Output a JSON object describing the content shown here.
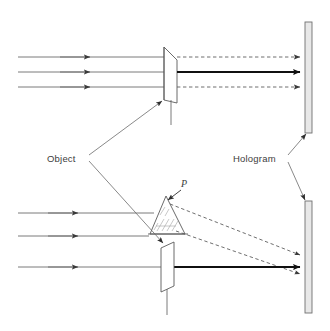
{
  "figure": {
    "type": "optics-ray-diagram",
    "title": "",
    "background_color": "#ffffff",
    "width": 330,
    "height": 331
  },
  "labels": {
    "object": "Object",
    "hologram": "Hologram",
    "point_p": "P"
  },
  "colors": {
    "ray_line": "#6b6b6b",
    "ray_bold": "#1a1a1a",
    "outline": "#5a5a5a",
    "plate_fill": "#e8e8e8",
    "plate_stroke": "#707070",
    "text": "#3d3d3d",
    "dashed": "#5f5f5f"
  },
  "panels": [
    {
      "name": "upper-panel",
      "description": "Parallel beam illuminating a flat object; undiffracted rays continue to the hologram plate",
      "incoming_rays": [
        {
          "y": 57,
          "x_start": 18,
          "x_end": 166,
          "arrow_x": 88
        },
        {
          "y": 72,
          "x_start": 18,
          "x_end": 166,
          "arrow_x": 88
        },
        {
          "y": 87,
          "x_start": 18,
          "x_end": 166,
          "arrow_x": 88
        }
      ],
      "outgoing_rays": [
        {
          "y": 57,
          "x_start": 176,
          "x_end": 300,
          "style": "dashed"
        },
        {
          "y": 72,
          "x_start": 176,
          "x_end": 300,
          "style": "solid-bold"
        },
        {
          "y": 87,
          "x_start": 176,
          "x_end": 300,
          "style": "dashed"
        }
      ],
      "object": {
        "shape": "flat-plate-arrowhead",
        "x": 163,
        "y_top": 47,
        "y_bottom": 100,
        "stem_y_bottom": 125
      },
      "hologram_plate": {
        "x": 305,
        "y_top": 22,
        "y_bottom": 133,
        "width": 7
      }
    },
    {
      "name": "lower-panel",
      "description": "Parallel beam scattering off point P on a three-dimensional object; diffracted rays diverge toward the hologram plate",
      "incoming_rays": [
        {
          "y": 213,
          "x_start": 18,
          "x_end": 152,
          "arrow_x": 75
        },
        {
          "y": 236,
          "x_start": 18,
          "x_end": 147,
          "arrow_x": 75
        },
        {
          "y": 267,
          "x_start": 18,
          "x_end": 166,
          "arrow_x": 75
        }
      ],
      "outgoing_rays": [
        {
          "from": [
            176,
            203
          ],
          "to": [
            300,
            253
          ],
          "style": "dashed"
        },
        {
          "from": [
            176,
            228
          ],
          "to": [
            300,
            272
          ],
          "style": "dashed"
        },
        {
          "from": [
            176,
            267
          ],
          "to": [
            300,
            267
          ],
          "style": "solid-bold"
        }
      ],
      "object_triangle": {
        "apex": [
          166,
          196
        ],
        "left": [
          150,
          234
        ],
        "right": [
          184,
          234
        ],
        "hatched": true,
        "point_label": "P"
      },
      "object_plate": {
        "shape": "parallelogram",
        "x": 160,
        "y_top": 244,
        "y_bottom": 292,
        "stem_y_bottom": 315
      },
      "hologram_plate": {
        "x": 305,
        "y_top": 201,
        "y_bottom": 313,
        "width": 7
      }
    }
  ],
  "annotations": [
    {
      "name": "object-callout",
      "text": "Object",
      "text_x": 47,
      "text_y": 159,
      "leaders": [
        {
          "from": [
            88,
            156
          ],
          "to": [
            161,
            100
          ]
        },
        {
          "from": [
            88,
            160
          ],
          "to": [
            163,
            242
          ]
        }
      ]
    },
    {
      "name": "hologram-callout",
      "text": "Hologram",
      "text_x": 238,
      "text_y": 159,
      "leaders": [
        {
          "from": [
            287,
            155
          ],
          "to": [
            305,
            131
          ]
        },
        {
          "from": [
            287,
            162
          ],
          "to": [
            304,
            203
          ]
        }
      ]
    },
    {
      "name": "p-callout",
      "text": "P",
      "text_x": 182,
      "text_y": 187,
      "leader": {
        "from": [
          180,
          190
        ],
        "to": [
          167,
          200
        ]
      }
    }
  ]
}
